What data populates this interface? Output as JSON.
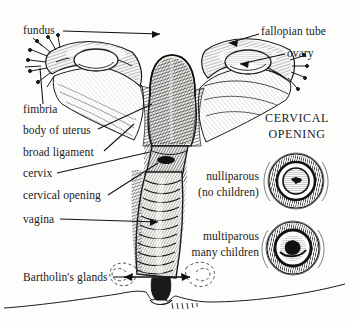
{
  "figure": {
    "style": "engraving / pen-and-ink hatched line art",
    "background_color": "#fdfdfb",
    "ink_color": "#1a1a1a"
  },
  "labels": {
    "fundus": "fundus",
    "fimbria": "fimbria",
    "body_of_uterus": "body of uterus",
    "broad_ligament": "broad ligament",
    "cervix": "cervix",
    "cervical_opening": "cervical opening",
    "vagina": "vagina",
    "bartholins_glands": "Bartholin's glands",
    "fallopian_tube": "fallopian tube",
    "ovary": "ovary"
  },
  "panel": {
    "title_line1": "CERVICAL",
    "title_line2": "OPENING",
    "items": [
      {
        "name": "nulliparous",
        "detail": "(no children)"
      },
      {
        "name": "multiparous",
        "detail": "many children"
      }
    ]
  }
}
